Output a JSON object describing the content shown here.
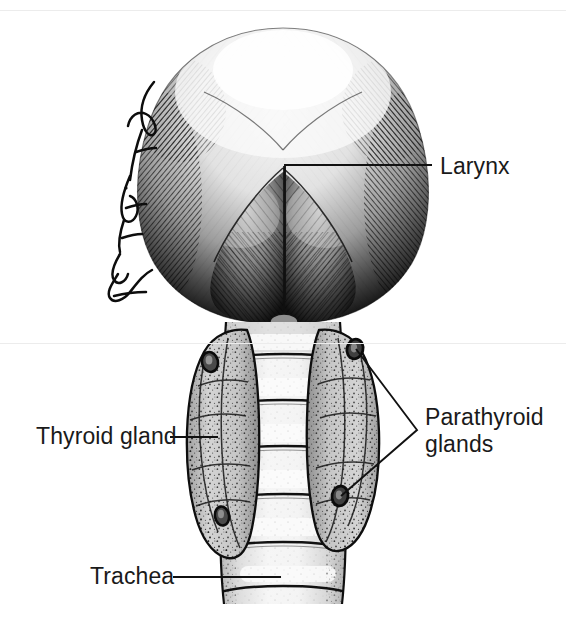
{
  "figure": {
    "type": "anatomical-illustration",
    "artist_signature": "Joan E. Christian",
    "background_color": "#ffffff",
    "ink_color": "#141414",
    "tissue_fill": "#d9d9d9",
    "trachea_light": "#f2f2f2",
    "gland_fill": "#cfcfcf"
  },
  "labels": {
    "larynx": "Larynx",
    "thyroid": "Thyroid gland",
    "parathyroid_line1": "Parathyroid",
    "parathyroid_line2": "glands",
    "trachea": "Trachea"
  },
  "leaders": {
    "larynx": {
      "x1": 285,
      "y1": 165,
      "x2": 432,
      "y2": 165
    },
    "larynx_stem": {
      "x1": 285,
      "y1": 165,
      "x2": 285,
      "y2": 300
    },
    "thyroid": {
      "x1": 170,
      "y1": 437,
      "x2": 218,
      "y2": 437
    },
    "trachea": {
      "x1": 173,
      "y1": 577,
      "x2": 280,
      "y2": 577
    },
    "parathyroid_apex": {
      "x": 417,
      "y": 430
    },
    "parathyroid_upper": {
      "x": 356,
      "y": 349
    },
    "parathyroid_lower": {
      "x": 341,
      "y": 496
    }
  },
  "structures": {
    "larynx": {
      "center_x": 283,
      "center_y": 175,
      "width": 250,
      "height": 290
    },
    "trachea": {
      "center_x": 283,
      "top": 322,
      "bottom": 604,
      "width": 116,
      "rings": 7
    },
    "thyroid_left_lobe": {
      "center_x": 222,
      "top": 330,
      "bottom": 560
    },
    "thyroid_right_lobe": {
      "center_x": 345,
      "top": 330,
      "bottom": 552
    },
    "parathyroid_count": 4
  },
  "scan_artifacts": {
    "line_top_y": 10,
    "line_mid_y": 343,
    "line_color": "#ececec"
  }
}
